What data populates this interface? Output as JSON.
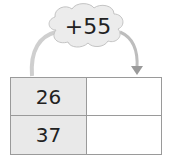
{
  "operation": {
    "label": "+55"
  },
  "table": {
    "rows": [
      {
        "input": "26",
        "output": ""
      },
      {
        "input": "37",
        "output": ""
      }
    ]
  },
  "colors": {
    "cloud": "#ececec",
    "input_cell": "#e9e9e9",
    "border": "#9a9a9a",
    "arrow": "#c8c8c8"
  }
}
